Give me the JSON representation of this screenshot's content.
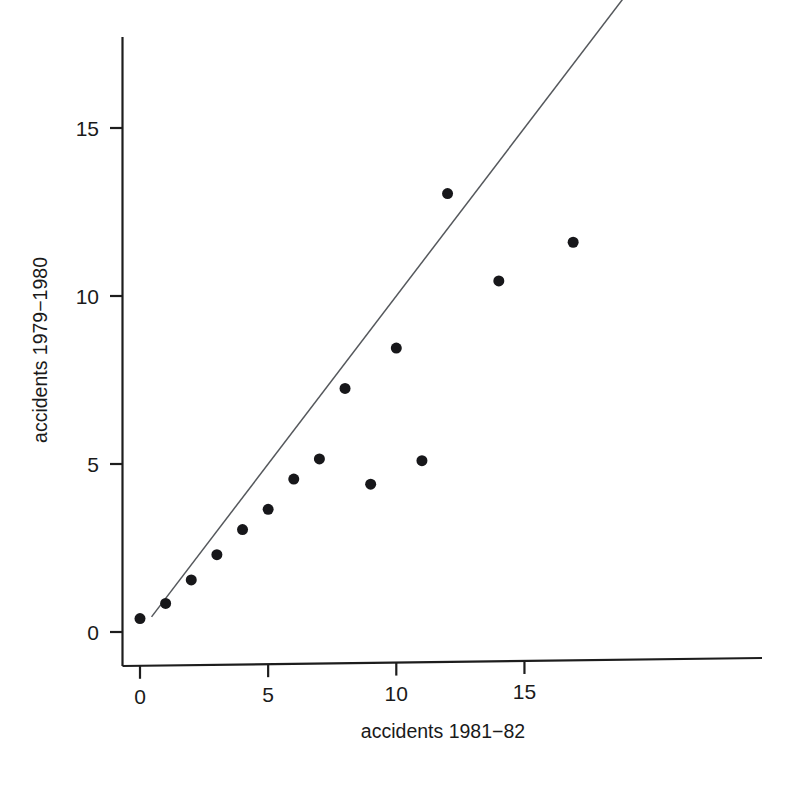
{
  "chart_data": {
    "type": "scatter",
    "title": "",
    "subtitle": "",
    "xlabel": "accidents 1981−82",
    "ylabel": "accidents 1979−1980",
    "xlim": [
      -0.7,
      24.4
    ],
    "ylim": [
      -1.2,
      18.5
    ],
    "xticks": [
      0,
      5,
      10,
      15
    ],
    "yticks": [
      0,
      5,
      10,
      15
    ],
    "xticklabels": [
      "0",
      "5",
      "10",
      "15"
    ],
    "yticklabels": [
      "0",
      "5",
      "10",
      "15"
    ],
    "grid": false,
    "legend": null,
    "legend_position": "none",
    "marker": "filled-circle",
    "marker_color": "#17171a",
    "marker_size_px": 11,
    "points": [
      {
        "x": 0.0,
        "y": 0.4
      },
      {
        "x": 1.0,
        "y": 0.85
      },
      {
        "x": 2.0,
        "y": 1.55
      },
      {
        "x": 3.0,
        "y": 2.3
      },
      {
        "x": 4.0,
        "y": 3.05
      },
      {
        "x": 5.0,
        "y": 3.65
      },
      {
        "x": 6.0,
        "y": 4.55
      },
      {
        "x": 7.0,
        "y": 5.15
      },
      {
        "x": 8.0,
        "y": 7.25
      },
      {
        "x": 9.0,
        "y": 4.4
      },
      {
        "x": 10.0,
        "y": 8.45
      },
      {
        "x": 11.0,
        "y": 5.1
      },
      {
        "x": 12.0,
        "y": 13.05
      },
      {
        "x": 14.0,
        "y": 10.45
      },
      {
        "x": 16.9,
        "y": 11.6
      }
    ],
    "reference_line": {
      "name": "identity-line",
      "slope": 1,
      "intercept": 0,
      "x_start": 0.45,
      "x_end": 22.85,
      "color": "#55585c",
      "style": "solid"
    },
    "annotations": []
  },
  "axes": {
    "x_axis_name": "x-axis",
    "y_axis_name": "y-axis",
    "axis_color": "#1d1d1d"
  }
}
